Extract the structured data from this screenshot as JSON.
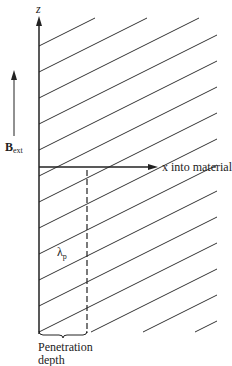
{
  "diagram": {
    "axis_z_label": "z",
    "axis_x_label": "x into material",
    "field_label_main": "B",
    "field_label_sub": "ext",
    "lambda_main": "λ",
    "lambda_sub": "p",
    "depth_label_line1": "Penetration",
    "depth_label_line2": "depth",
    "colors": {
      "ink": "#222222",
      "background": "#ffffff"
    }
  }
}
